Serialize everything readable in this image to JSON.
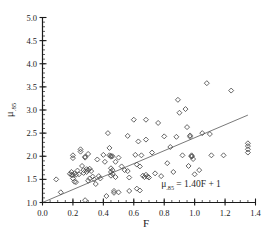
{
  "chart_data": {
    "type": "scatter",
    "title": "",
    "subtitle": "",
    "xlabel": "F",
    "ylabel": "μ.85",
    "ylabel_base": "μ",
    "ylabel_sub": ".85",
    "xlim": [
      0.0,
      1.4
    ],
    "ylim": [
      1.0,
      5.0
    ],
    "xticks": [
      0.0,
      0.2,
      0.4,
      0.6,
      0.8,
      1.0,
      1.2,
      1.4
    ],
    "xtick_labels": [
      "0.0",
      "0.2",
      "0.4",
      "0.6",
      "0.8",
      "1.0",
      "1.2",
      "1.4"
    ],
    "xminor_step": 0.05,
    "yticks": [
      1.0,
      1.5,
      2.0,
      2.5,
      3.0,
      3.5,
      4.0,
      4.5,
      5.0
    ],
    "ytick_labels": [
      "1.0",
      "1.5",
      "2.0",
      "2.5",
      "3.0",
      "3.5",
      "4.0",
      "4.5",
      "5.0"
    ],
    "yminor_step": 0.1,
    "grid": false,
    "legend": null,
    "marker": "diamond-open",
    "marker_color": "#4a4a4a",
    "line_color": "#7a7a7a",
    "axis_color": "#1a1a1a",
    "annotations": [
      {
        "name": "regression-equation",
        "text": "μ.85 = 1.40F + 1",
        "base": "μ",
        "sub": ".85",
        "rest": " = 1.40F + 1",
        "x": 0.78,
        "y": 1.33
      }
    ],
    "fit_line": {
      "name": "regression-line",
      "equation": "μ.85 = 1.40F + 1",
      "slope": 1.4,
      "intercept": 1.0,
      "x_start": 0.0,
      "x_end": 1.35,
      "y_start": 1.0,
      "y_end": 2.89
    },
    "series": [
      {
        "name": "observations",
        "marker": "diamond-open",
        "points": [
          [
            0.09,
            1.5
          ],
          [
            0.12,
            1.22
          ],
          [
            0.18,
            1.62
          ],
          [
            0.19,
            1.66
          ],
          [
            0.19,
            1.6
          ],
          [
            0.2,
            2.02
          ],
          [
            0.2,
            1.96
          ],
          [
            0.2,
            1.59
          ],
          [
            0.2,
            1.52
          ],
          [
            0.21,
            1.63
          ],
          [
            0.21,
            1.45
          ],
          [
            0.22,
            1.6
          ],
          [
            0.22,
            1.44
          ],
          [
            0.23,
            1.69
          ],
          [
            0.24,
            1.61
          ],
          [
            0.25,
            2.15
          ],
          [
            0.25,
            2.1
          ],
          [
            0.26,
            1.79
          ],
          [
            0.27,
            1.7
          ],
          [
            0.27,
            1.64
          ],
          [
            0.28,
            1.99
          ],
          [
            0.28,
            1.97
          ],
          [
            0.28,
            1.05
          ],
          [
            0.29,
            1.72
          ],
          [
            0.29,
            1.66
          ],
          [
            0.3,
            2.05
          ],
          [
            0.3,
            1.7
          ],
          [
            0.3,
            1.47
          ],
          [
            0.31,
            1.73
          ],
          [
            0.31,
            1.52
          ],
          [
            0.32,
            1.68
          ],
          [
            0.33,
            1.56
          ],
          [
            0.34,
            1.5
          ],
          [
            0.35,
            1.4
          ],
          [
            0.36,
            1.93
          ],
          [
            0.37,
            1.57
          ],
          [
            0.38,
            1.52
          ],
          [
            0.4,
            2.03
          ],
          [
            0.41,
            1.88
          ],
          [
            0.42,
            1.14
          ],
          [
            0.43,
            2.5
          ],
          [
            0.44,
            2.18
          ],
          [
            0.44,
            2.02
          ],
          [
            0.45,
            2.01
          ],
          [
            0.45,
            1.99
          ],
          [
            0.45,
            1.74
          ],
          [
            0.45,
            1.66
          ],
          [
            0.45,
            1.58
          ],
          [
            0.46,
            2.0
          ],
          [
            0.46,
            1.7
          ],
          [
            0.46,
            1.62
          ],
          [
            0.47,
            1.25
          ],
          [
            0.47,
            1.21
          ],
          [
            0.48,
            1.88
          ],
          [
            0.48,
            1.55
          ],
          [
            0.5,
            1.97
          ],
          [
            0.5,
            1.22
          ],
          [
            0.52,
            1.78
          ],
          [
            0.54,
            1.7
          ],
          [
            0.56,
            2.44
          ],
          [
            0.56,
            1.68
          ],
          [
            0.57,
            1.54
          ],
          [
            0.57,
            1.25
          ],
          [
            0.6,
            2.79
          ],
          [
            0.61,
            2.03
          ],
          [
            0.62,
            1.82
          ],
          [
            0.62,
            1.3
          ],
          [
            0.63,
            2.32
          ],
          [
            0.64,
            1.78
          ],
          [
            0.64,
            1.26
          ],
          [
            0.65,
            2.02
          ],
          [
            0.66,
            1.58
          ],
          [
            0.67,
            1.55
          ],
          [
            0.68,
            2.79
          ],
          [
            0.68,
            2.36
          ],
          [
            0.68,
            1.6
          ],
          [
            0.69,
            1.56
          ],
          [
            0.7,
            1.54
          ],
          [
            0.72,
            2.08
          ],
          [
            0.74,
            1.63
          ],
          [
            0.76,
            2.72
          ],
          [
            0.78,
            1.57
          ],
          [
            0.8,
            2.43
          ],
          [
            0.82,
            1.85
          ],
          [
            0.84,
            2.2
          ],
          [
            0.86,
            1.66
          ],
          [
            0.88,
            2.42
          ],
          [
            0.89,
            3.22
          ],
          [
            0.9,
            2.94
          ],
          [
            0.92,
            2.02
          ],
          [
            0.94,
            3.02
          ],
          [
            0.95,
            2.63
          ],
          [
            0.96,
            1.79
          ],
          [
            0.97,
            2.45
          ],
          [
            0.97,
            2.42
          ],
          [
            0.98,
            2.02
          ],
          [
            0.98,
            2.0
          ],
          [
            0.98,
            1.99
          ],
          [
            0.99,
            1.94
          ],
          [
            1.0,
            1.61
          ],
          [
            1.03,
            1.7
          ],
          [
            1.05,
            2.5
          ],
          [
            1.08,
            3.58
          ],
          [
            1.1,
            2.48
          ],
          [
            1.11,
            2.02
          ],
          [
            1.19,
            2.02
          ],
          [
            1.24,
            3.42
          ],
          [
            1.35,
            2.28
          ],
          [
            1.35,
            2.22
          ],
          [
            1.35,
            2.15
          ],
          [
            1.35,
            2.08
          ]
        ]
      }
    ]
  }
}
